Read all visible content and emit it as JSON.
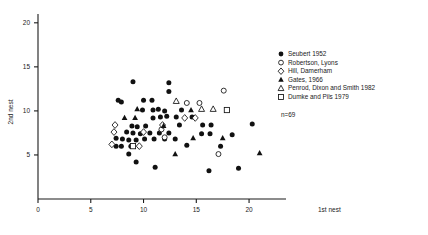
{
  "chart_data": {
    "type": "scatter",
    "title": "",
    "xlabel": "1st nest",
    "ylabel": "2nd nest",
    "xlim": [
      0,
      23.5
    ],
    "ylim": [
      0,
      21
    ],
    "xticks": [
      0,
      5,
      10,
      15,
      20
    ],
    "yticks": [
      5,
      10,
      15,
      20
    ],
    "xtick_labels": [
      "0",
      "5",
      "10",
      "15",
      "20"
    ],
    "ytick_labels": [
      "5",
      "10",
      "15",
      "20"
    ],
    "grid": false,
    "annotation": "n=69",
    "legend_position": "right",
    "series": [
      {
        "name": "Seubert 1952",
        "marker": "filled-circle",
        "color": "#111111",
        "points": [
          [
            9.0,
            13.3
          ],
          [
            12.4,
            13.2
          ],
          [
            12.4,
            12.2
          ],
          [
            7.6,
            11.2
          ],
          [
            7.9,
            11.0
          ],
          [
            10.0,
            11.2
          ],
          [
            10.8,
            11.2
          ],
          [
            9.9,
            10.1
          ],
          [
            10.9,
            10.1
          ],
          [
            10.9,
            9.2
          ],
          [
            11.6,
            9.3
          ],
          [
            12.2,
            9.4
          ],
          [
            13.1,
            9.3
          ],
          [
            14.6,
            9.3
          ],
          [
            8.9,
            8.3
          ],
          [
            9.4,
            8.2
          ],
          [
            10.2,
            8.3
          ],
          [
            13.4,
            8.4
          ],
          [
            15.6,
            8.4
          ],
          [
            16.4,
            8.4
          ],
          [
            8.4,
            7.6
          ],
          [
            9.0,
            7.5
          ],
          [
            9.7,
            7.4
          ],
          [
            10.6,
            7.5
          ],
          [
            11.5,
            7.5
          ],
          [
            12.4,
            7.5
          ],
          [
            7.4,
            6.9
          ],
          [
            8.0,
            6.8
          ],
          [
            8.6,
            6.7
          ],
          [
            9.3,
            6.7
          ],
          [
            10.1,
            6.8
          ],
          [
            11.0,
            6.8
          ],
          [
            12.0,
            6.8
          ],
          [
            13.0,
            6.8
          ],
          [
            20.3,
            8.5
          ],
          [
            7.4,
            6.0
          ],
          [
            7.9,
            6.0
          ],
          [
            8.8,
            6.0
          ],
          [
            8.6,
            5.1
          ],
          [
            14.1,
            6.1
          ],
          [
            17.3,
            6.0
          ],
          [
            9.3,
            4.2
          ],
          [
            11.1,
            3.6
          ],
          [
            16.2,
            3.2
          ],
          [
            19.0,
            3.5
          ],
          [
            11.4,
            10.2
          ],
          [
            12.0,
            10.0
          ],
          [
            13.6,
            10.1
          ],
          [
            15.5,
            7.4
          ],
          [
            16.3,
            7.4
          ],
          [
            18.4,
            7.3
          ]
        ]
      },
      {
        "name": "Robertson, Lyons",
        "marker": "open-circle",
        "color": "#111111",
        "points": [
          [
            17.6,
            12.3
          ],
          [
            14.1,
            10.9
          ],
          [
            15.3,
            10.9
          ],
          [
            11.7,
            7.9
          ],
          [
            12.0,
            7.0
          ],
          [
            17.1,
            5.1
          ]
        ]
      },
      {
        "name": "Hill, Damerham",
        "marker": "open-diamond",
        "color": "#111111",
        "points": [
          [
            7.3,
            8.4
          ],
          [
            11.8,
            8.4
          ],
          [
            13.9,
            9.2
          ],
          [
            14.9,
            9.2
          ],
          [
            7.2,
            7.6
          ],
          [
            10.0,
            7.6
          ],
          [
            7.0,
            6.2
          ],
          [
            9.6,
            6.0
          ]
        ]
      },
      {
        "name": "Gates, 1966",
        "marker": "filled-triangle",
        "color": "#111111",
        "points": [
          [
            9.4,
            10.2
          ],
          [
            8.2,
            9.2
          ],
          [
            9.2,
            9.2
          ],
          [
            14.5,
            10.1
          ],
          [
            11.9,
            8.3
          ],
          [
            14.7,
            6.9
          ],
          [
            13.0,
            5.1
          ],
          [
            17.5,
            6.9
          ],
          [
            21.0,
            5.2
          ]
        ]
      },
      {
        "name": "Penrod, Dixon and Smith 1982",
        "marker": "open-triangle",
        "color": "#111111",
        "points": [
          [
            13.1,
            11.1
          ],
          [
            15.5,
            10.2
          ],
          [
            16.6,
            10.2
          ]
        ]
      },
      {
        "name": "Dumke and Pils 1979",
        "marker": "open-square",
        "color": "#111111",
        "points": [
          [
            17.9,
            10.1
          ],
          [
            9.0,
            6.0
          ]
        ]
      }
    ]
  },
  "legend": {
    "entries": [
      {
        "label": "Seubert 1952",
        "marker": "filled-circle"
      },
      {
        "label": "Robertson, Lyons",
        "marker": "open-circle"
      },
      {
        "label": "Hill, Damerham",
        "marker": "open-diamond"
      },
      {
        "label": "Gates, 1966",
        "marker": "filled-triangle"
      },
      {
        "label": "Penrod, Dixon and Smith 1982",
        "marker": "open-triangle"
      },
      {
        "label": "Dumke and Pils 1979",
        "marker": "open-square"
      }
    ],
    "note": "n=69"
  },
  "colors": {
    "ink": "#1a1a1a",
    "marker": "#111111",
    "background": "#ffffff"
  }
}
